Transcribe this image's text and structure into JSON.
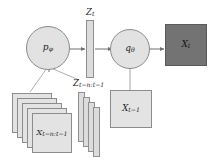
{
  "diagram": {
    "colors": {
      "node_fill": "#e2e2e2",
      "node_stroke": "#8c8c8c",
      "slab_fill": "#dcdcdc",
      "square_fill": "#e3e3e3",
      "observed_fill": "#737373",
      "wire": "#777777",
      "text": "#1a1a1a",
      "background": "#ffffff"
    },
    "nodes": {
      "prior": {
        "base": "p",
        "subscript": "φ",
        "shape": "circle"
      },
      "decoder": {
        "base": "q",
        "subscript": "θ",
        "shape": "circle"
      }
    },
    "latents": {
      "current": {
        "base": "Z",
        "subscript": "t",
        "shape": "slab"
      },
      "history": {
        "base": "Z",
        "subscript": "t−n:t−1",
        "shape": "slab-stack",
        "count": 4
      }
    },
    "observations": {
      "current": {
        "base": "X",
        "subscript": "t",
        "shape": "square",
        "observed": true
      },
      "previous": {
        "base": "X",
        "subscript": "t−1",
        "shape": "square",
        "observed": false
      },
      "history": {
        "base": "X",
        "subscript": "t−n:t−1",
        "shape": "square-stack",
        "count": 5,
        "observed": false
      }
    },
    "edges": [
      {
        "from": "prior",
        "to": "latent-current",
        "style": "arrow"
      },
      {
        "from": "latent-current",
        "to": "decoder",
        "style": "arrow"
      },
      {
        "from": "decoder",
        "to": "observation-current",
        "style": "arrow"
      },
      {
        "from": "observation-history",
        "to": "prior",
        "style": "arrow"
      },
      {
        "from": "latent-history",
        "to": "prior",
        "style": "arrow"
      },
      {
        "from": "observation-previous",
        "to": "decoder",
        "style": "arrow"
      }
    ]
  }
}
